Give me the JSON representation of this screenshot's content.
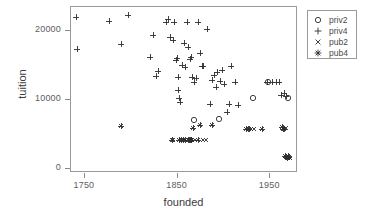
{
  "chart_data": {
    "type": "scatter",
    "title": "",
    "xlabel": "founded",
    "ylabel": "tuition",
    "xlim": [
      1735,
      1980
    ],
    "ylim": [
      -600,
      23400
    ],
    "xticks": [
      1750,
      1850,
      1950
    ],
    "xticklabels": [
      "1750",
      "1850",
      "1950"
    ],
    "yticks": [
      0,
      10000,
      20000
    ],
    "yticklabels": [
      "0",
      "10000",
      "20000"
    ],
    "grid": false,
    "legend_position": "right-outside",
    "series": [
      {
        "name": "priv2",
        "marker": "circle",
        "points": [
          [
            1868,
            7000
          ],
          [
            1895,
            7200
          ],
          [
            1931,
            10200
          ],
          [
            1948,
            12600
          ],
          [
            1969,
            10300
          ]
        ]
      },
      {
        "name": "priv4",
        "marker": "plus",
        "points": [
          [
            1740,
            22000
          ],
          [
            1742,
            17400
          ],
          [
            1776,
            21400
          ],
          [
            1789,
            18000
          ],
          [
            1796,
            22300
          ],
          [
            1820,
            16200
          ],
          [
            1824,
            19300
          ],
          [
            1827,
            13400
          ],
          [
            1829,
            14100
          ],
          [
            1837,
            21200
          ],
          [
            1840,
            21600
          ],
          [
            1842,
            19000
          ],
          [
            1845,
            18600
          ],
          [
            1846,
            21200
          ],
          [
            1848,
            15800
          ],
          [
            1849,
            16000
          ],
          [
            1850,
            13300
          ],
          [
            1851,
            11400
          ],
          [
            1852,
            10300
          ],
          [
            1853,
            9600
          ],
          [
            1855,
            15000
          ],
          [
            1857,
            18200
          ],
          [
            1858,
            14700
          ],
          [
            1860,
            21300
          ],
          [
            1861,
            17600
          ],
          [
            1863,
            15900
          ],
          [
            1864,
            16100
          ],
          [
            1866,
            13300
          ],
          [
            1868,
            12500
          ],
          [
            1870,
            13200
          ],
          [
            1872,
            21300
          ],
          [
            1874,
            16800
          ],
          [
            1876,
            14900
          ],
          [
            1878,
            14800
          ],
          [
            1882,
            20200
          ],
          [
            1885,
            9400
          ],
          [
            1887,
            12800
          ],
          [
            1889,
            13600
          ],
          [
            1891,
            11800
          ],
          [
            1893,
            14000
          ],
          [
            1896,
            12700
          ],
          [
            1898,
            14300
          ],
          [
            1900,
            12300
          ],
          [
            1903,
            8200
          ],
          [
            1905,
            9400
          ],
          [
            1908,
            14900
          ],
          [
            1912,
            12500
          ],
          [
            1915,
            9300
          ],
          [
            1947,
            12500
          ],
          [
            1952,
            12600
          ],
          [
            1956,
            12600
          ],
          [
            1960,
            12500
          ],
          [
            1962,
            10700
          ],
          [
            1965,
            10900
          ],
          [
            1967,
            10600
          ]
        ]
      },
      {
        "name": "pub2",
        "marker": "cross",
        "points": [
          [
            1845,
            4100
          ],
          [
            1858,
            4100
          ],
          [
            1866,
            4100
          ],
          [
            1869,
            4100
          ],
          [
            1878,
            4100
          ],
          [
            1881,
            4100
          ],
          [
            1929,
            5700
          ],
          [
            1933,
            5700
          ],
          [
            1967,
            5900
          ],
          [
            1969,
            1600
          ],
          [
            1971,
            1500
          ]
        ]
      },
      {
        "name": "pub4",
        "marker": "star",
        "points": [
          [
            1789,
            6200
          ],
          [
            1844,
            4100
          ],
          [
            1852,
            4200
          ],
          [
            1854,
            4100
          ],
          [
            1856,
            4100
          ],
          [
            1858,
            4100
          ],
          [
            1861,
            4100
          ],
          [
            1862,
            4100
          ],
          [
            1863,
            4100
          ],
          [
            1864,
            4100
          ],
          [
            1865,
            4100
          ],
          [
            1867,
            5900
          ],
          [
            1872,
            4100
          ],
          [
            1874,
            6400
          ],
          [
            1887,
            6300
          ],
          [
            1924,
            5700
          ],
          [
            1926,
            5700
          ],
          [
            1927,
            5800
          ],
          [
            1941,
            5800
          ],
          [
            1963,
            6000
          ],
          [
            1964,
            5800
          ],
          [
            1965,
            5700
          ],
          [
            1966,
            1800
          ],
          [
            1967,
            1700
          ],
          [
            1968,
            1600
          ],
          [
            1969,
            1900
          ],
          [
            1970,
            1700
          ]
        ]
      }
    ]
  },
  "legend": {
    "entries": [
      {
        "label": "priv2",
        "marker": "circle"
      },
      {
        "label": "priv4",
        "marker": "plus"
      },
      {
        "label": "pub2",
        "marker": "cross"
      },
      {
        "label": "pub4",
        "marker": "star"
      }
    ]
  }
}
